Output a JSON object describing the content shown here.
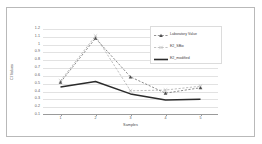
{
  "chart_data": {
    "type": "line",
    "title": "",
    "xlabel": "Samples",
    "ylabel": "Cl Values",
    "categories": [
      "1",
      "2",
      "3",
      "4",
      "5"
    ],
    "x": [
      1,
      2,
      3,
      4,
      5
    ],
    "xlim": [
      0.5,
      5.5
    ],
    "ylim": [
      0.1,
      1.2
    ],
    "yticks": [
      "1.2",
      "1.1",
      "1",
      "0.9",
      "0.8",
      "0.7",
      "0.6",
      "0.5",
      "0.4",
      "0.3",
      "0.2",
      "0.1"
    ],
    "ytick_values": [
      1.2,
      1.1,
      1.0,
      0.9,
      0.8,
      0.7,
      0.6,
      0.5,
      0.4,
      0.3,
      0.2,
      0.1
    ],
    "grid": true,
    "legend_position": "top-right",
    "series": [
      {
        "name": "Laboratory Value",
        "values": [
          0.51,
          1.08,
          0.58,
          0.37,
          0.44
        ],
        "color": "#4d4d4d",
        "style": "dashed",
        "marker": "triangle"
      },
      {
        "name": "E2_SBio",
        "values": [
          0.53,
          1.11,
          0.4,
          0.41,
          0.46
        ],
        "color": "#9a9a9a",
        "style": "dashed",
        "marker": "cross"
      },
      {
        "name": "E2_modified",
        "values": [
          0.45,
          0.52,
          0.36,
          0.28,
          0.29
        ],
        "color": "#2b2b2b",
        "style": "solid",
        "marker": "none"
      }
    ]
  },
  "figure": {
    "axis_color": "#9a9a9a",
    "grid_color": "#e2e2e2",
    "background": "#ffffff",
    "frame_color": "#b9b9b9"
  }
}
